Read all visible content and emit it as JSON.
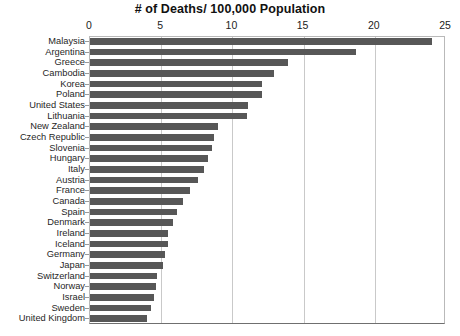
{
  "chart_data": {
    "type": "bar",
    "orientation": "horizontal",
    "title": "# of Deaths/ 100,000 Population",
    "xlabel": "",
    "ylabel": "",
    "xlim": [
      0,
      25
    ],
    "xticks": [
      0,
      5,
      10,
      15,
      20,
      25
    ],
    "grid": true,
    "legend": null,
    "bar_color": "#575757",
    "categories": [
      "Malaysia",
      "Argentina",
      "Greece",
      "Cambodia",
      "Korea",
      "Poland",
      "United States",
      "Lithuania",
      "New Zealand",
      "Czech Republic",
      "Slovenia",
      "Hungary",
      "Italy",
      "Austria",
      "France",
      "Canada",
      "Spain",
      "Denmark",
      "Ireland",
      "Iceland",
      "Germany",
      "Japan",
      "Switzerland",
      "Norway",
      "Israel",
      "Sweden",
      "United Kingdom"
    ],
    "values": [
      24.0,
      18.7,
      13.9,
      12.9,
      12.1,
      12.1,
      11.1,
      11.0,
      9.0,
      8.7,
      8.6,
      8.3,
      8.0,
      7.6,
      7.0,
      6.5,
      6.1,
      5.8,
      5.5,
      5.5,
      5.3,
      5.1,
      4.7,
      4.6,
      4.5,
      4.3,
      4.0
    ]
  }
}
